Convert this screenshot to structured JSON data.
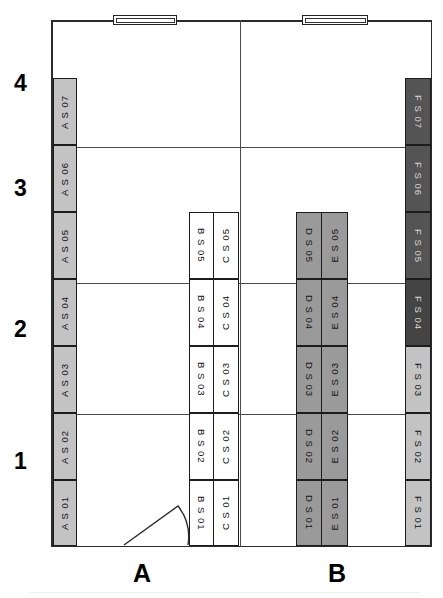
{
  "plan": {
    "title": "Bay module floor plan",
    "row_labels": [
      "4",
      "3",
      "2",
      "1"
    ],
    "column_labels": [
      "A",
      "B"
    ],
    "windows": [
      {
        "name": "window-left"
      },
      {
        "name": "window-right"
      }
    ],
    "door": {
      "name": "door-swing-arc"
    },
    "columns": [
      {
        "id": "A",
        "tone": "tone-light",
        "modules": [
          {
            "label": "A S 07"
          },
          {
            "label": "A S 06"
          },
          {
            "label": "A S 05"
          },
          {
            "label": "A S 04"
          },
          {
            "label": "A S 03"
          },
          {
            "label": "A S 02"
          },
          {
            "label": "A S 01"
          }
        ]
      },
      {
        "id": "B",
        "tone": "tone-white",
        "modules": [
          {
            "label": "B S 05"
          },
          {
            "label": "B S 04"
          },
          {
            "label": "B S 03"
          },
          {
            "label": "B S 02"
          },
          {
            "label": "B S 01"
          }
        ]
      },
      {
        "id": "C",
        "tone": "tone-white",
        "modules": [
          {
            "label": "C S 05"
          },
          {
            "label": "C S 04"
          },
          {
            "label": "C S 03"
          },
          {
            "label": "C S 02"
          },
          {
            "label": "C S 01"
          }
        ]
      },
      {
        "id": "D",
        "tone": "tone-mid",
        "modules": [
          {
            "label": "D S 05"
          },
          {
            "label": "D S 04"
          },
          {
            "label": "D S 03"
          },
          {
            "label": "D S 02"
          },
          {
            "label": "D S 01"
          }
        ]
      },
      {
        "id": "E",
        "tone": "tone-mid",
        "modules": [
          {
            "label": "E S 05"
          },
          {
            "label": "E S 04"
          },
          {
            "label": "E S 03"
          },
          {
            "label": "E S 02"
          },
          {
            "label": "E S 01"
          }
        ]
      },
      {
        "id": "F",
        "tone": "tone-dark",
        "modules": [
          {
            "label": "F S 07"
          },
          {
            "label": "F S 06"
          },
          {
            "label": "F S 05"
          },
          {
            "label": "F S 04"
          },
          {
            "label": "F S 03"
          },
          {
            "label": "F S 02"
          },
          {
            "label": "F S 01"
          }
        ]
      }
    ]
  },
  "colors": {
    "wall": "#2b2b2b",
    "gridline": "#4a4a4a",
    "tone_white": "#ffffff",
    "tone_light": "#c3c3c3",
    "tone_mid": "#9a9a9a",
    "tone_dark": "#545454"
  }
}
